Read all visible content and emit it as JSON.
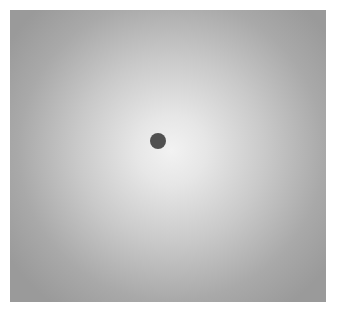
{
  "figure": {
    "background_center_color": "#f2f2f2",
    "background_edge_color": "#9a9a9a",
    "dot": {
      "color": "#505050",
      "center_x": 158,
      "center_y": 141,
      "radius": 8
    }
  }
}
